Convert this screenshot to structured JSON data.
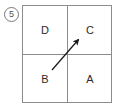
{
  "figure": {
    "item_number": "5",
    "quadrants": [
      {
        "id": "top-left",
        "label": "D"
      },
      {
        "id": "top-right",
        "label": "C"
      },
      {
        "id": "bottom-left",
        "label": "B"
      },
      {
        "id": "bottom-right",
        "label": "A"
      }
    ],
    "arrow": {
      "name": "diagonal-arrow",
      "direction": "up-right",
      "from_quadrant": "B",
      "to_quadrant": "C",
      "tail_x": 52,
      "tail_y": 70,
      "tip_x": 81,
      "tip_y": 37
    },
    "colors": {
      "grid_line": "#8c8c8c",
      "letter_text": "#2b2b2b",
      "arrow": "#1a1a1a",
      "number_circle": "#7a7a7a",
      "background": "#ffffff"
    }
  }
}
